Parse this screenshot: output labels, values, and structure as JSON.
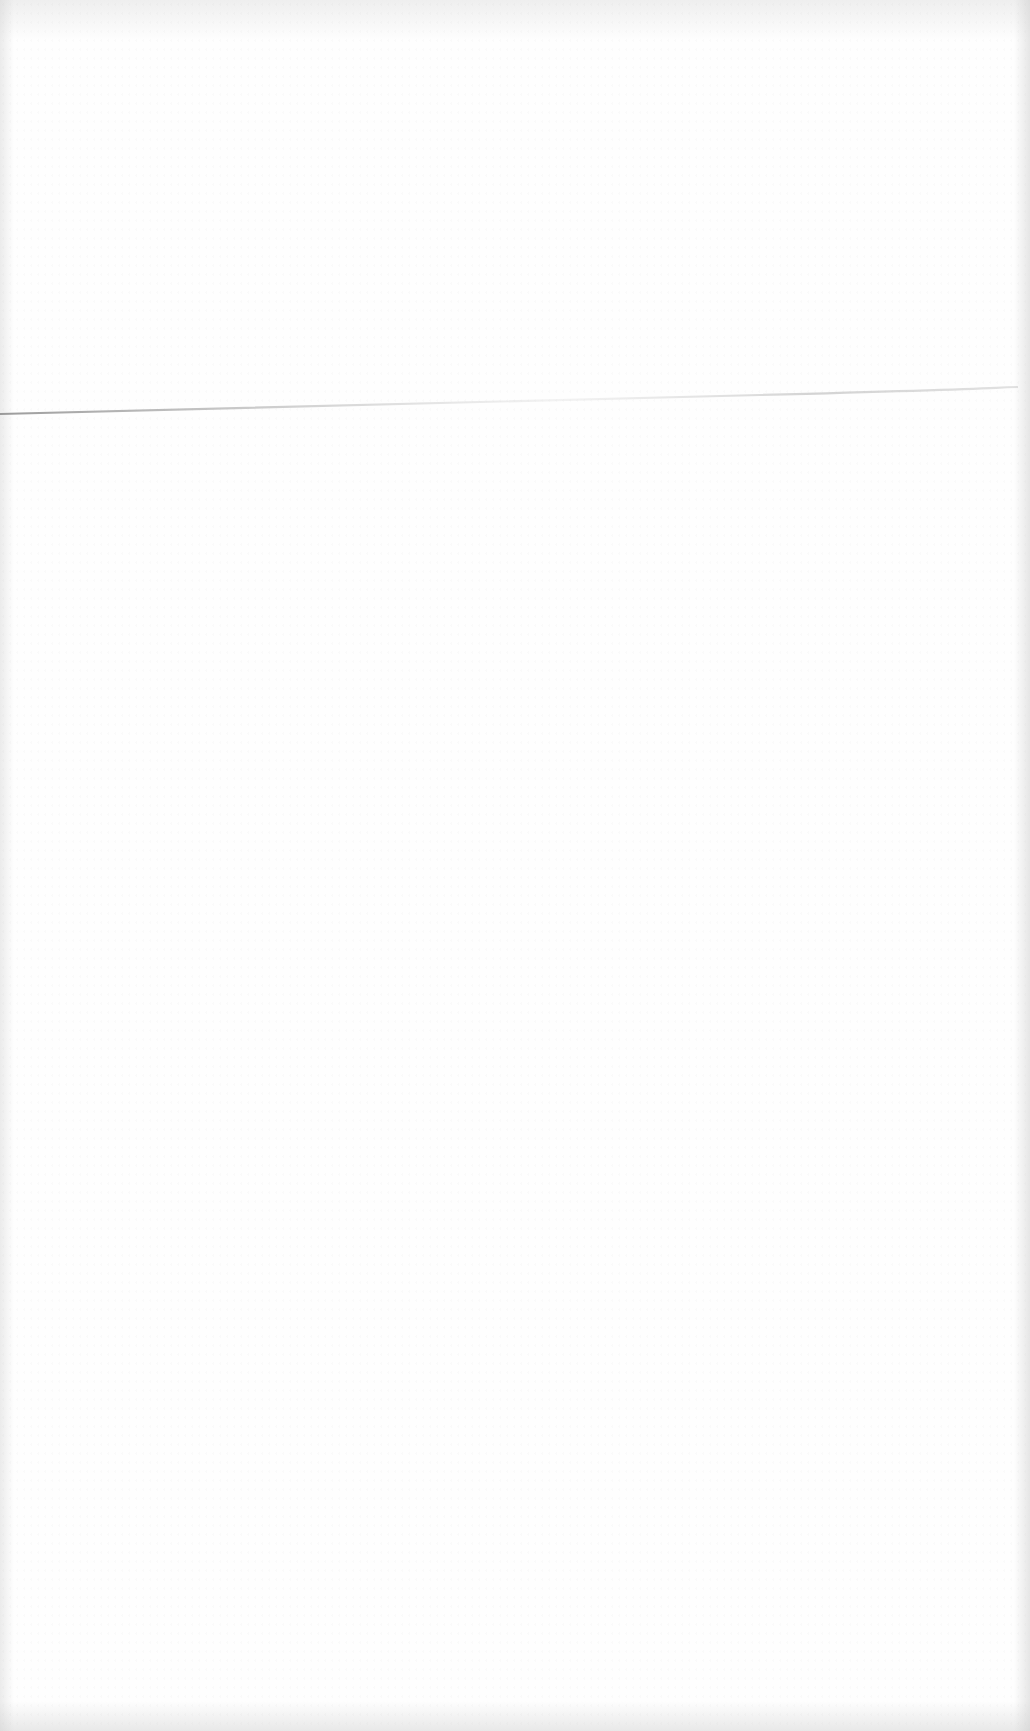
{
  "document": {
    "type": "blank-scanned-page",
    "text_content": "",
    "features": {
      "fold_line": {
        "present": true,
        "from": [
          0,
          413
        ],
        "to": [
          1030,
          388
        ],
        "color": "#9a9a9a"
      },
      "background_color": "#fefefe",
      "edge_shading_color": "#c8c8c8"
    }
  }
}
